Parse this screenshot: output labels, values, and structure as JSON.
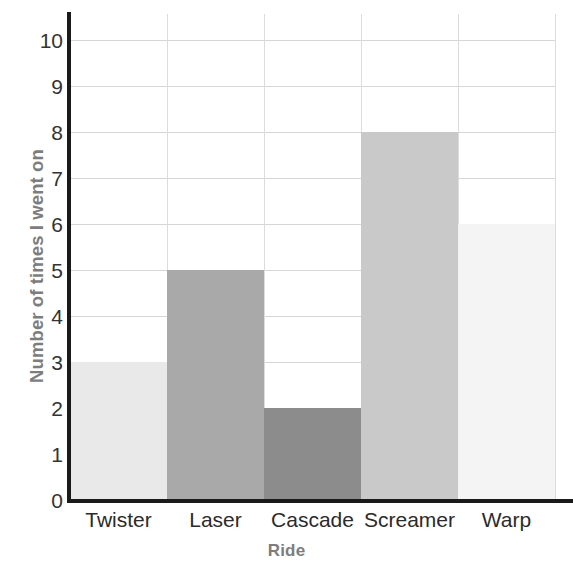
{
  "chart_data": {
    "type": "bar",
    "title": "",
    "categories": [
      "Twister",
      "Laser",
      "Cascade",
      "Screamer",
      "Warp"
    ],
    "values": [
      3,
      5,
      2,
      8,
      6
    ],
    "xlabel": "Ride",
    "ylabel": "Number of times I went on",
    "ylim": [
      0,
      10
    ],
    "ytick_labels": [
      "0",
      "1",
      "2",
      "3",
      "4",
      "5",
      "6",
      "7",
      "8",
      "9",
      "10"
    ],
    "ytick_values": [
      0,
      1,
      2,
      3,
      4,
      5,
      6,
      7,
      8,
      9,
      10
    ],
    "grid": true,
    "legend": false,
    "bar_colors": [
      "#e9e9e9",
      "#a9a9a9",
      "#8c8c8c",
      "#c9c9c9",
      "#f4f4f4"
    ],
    "bar_gap": 0,
    "colors": {
      "axis": "#1a1a1a",
      "gridline": "#d8d8d8",
      "tick_text": "#2b2b2b",
      "axis_title": "#7d7d7d",
      "background": "#ffffff"
    }
  }
}
